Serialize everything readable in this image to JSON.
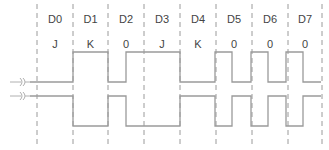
{
  "diagram": {
    "type": "timing-diagram",
    "bit_cells": [
      {
        "name": "D0",
        "symbol": "J"
      },
      {
        "name": "D1",
        "symbol": "K"
      },
      {
        "name": "D2",
        "symbol": "0"
      },
      {
        "name": "D3",
        "symbol": "J"
      },
      {
        "name": "D4",
        "symbol": "K"
      },
      {
        "name": "D5",
        "symbol": "0"
      },
      {
        "name": "D6",
        "symbol": "0"
      },
      {
        "name": "D7",
        "symbol": "0"
      }
    ],
    "grid_x": [
      37,
      73,
      108,
      144,
      180,
      216,
      252,
      288,
      322
    ],
    "traces": [
      {
        "name": "data-plus",
        "high_y": 52,
        "low_y": 82,
        "start_x": 30,
        "end_x": 321,
        "start_level": "low",
        "transitions_x": [
          73,
          108,
          126,
          180,
          215,
          232,
          251,
          268,
          286,
          303
        ]
      },
      {
        "name": "data-minus",
        "high_y": 96,
        "low_y": 126,
        "start_x": 30,
        "end_x": 321,
        "start_level": "high",
        "transitions_x": [
          73,
          108,
          126,
          180,
          215,
          232,
          251,
          268,
          286,
          303
        ]
      }
    ],
    "colors": {
      "text": "#444444",
      "lines": "#9a9a9a"
    }
  }
}
